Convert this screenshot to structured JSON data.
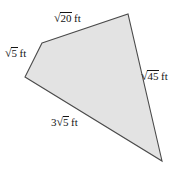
{
  "figure": {
    "type": "quadrilateral",
    "shape_name": "quadrilateral-diagram",
    "fill_color": "#e3e3e3",
    "stroke_color": "#4a4a4a",
    "background_color": "#ffffff",
    "vertices": [
      {
        "name": "top-left",
        "x": 42,
        "y": 43
      },
      {
        "name": "top-right",
        "x": 128,
        "y": 14
      },
      {
        "name": "bottom-right",
        "x": 162,
        "y": 161
      },
      {
        "name": "left",
        "x": 25,
        "y": 77
      }
    ],
    "unit": "ft",
    "radical_sign": "√",
    "sides": [
      {
        "position": "top",
        "coefficient": "",
        "radicand": "20",
        "unit": "ft",
        "full_text": "√20 ft",
        "from_vertex": "top-left",
        "to_vertex": "top-right"
      },
      {
        "position": "left",
        "coefficient": "",
        "radicand": "5",
        "unit": "ft",
        "full_text": "√5 ft",
        "from_vertex": "left",
        "to_vertex": "top-left"
      },
      {
        "position": "right",
        "coefficient": "",
        "radicand": "45",
        "unit": "ft",
        "full_text": "√45 ft",
        "from_vertex": "top-right",
        "to_vertex": "bottom-right"
      },
      {
        "position": "bottom",
        "coefficient": "3",
        "radicand": "5",
        "unit": "ft",
        "full_text": "3√5 ft",
        "from_vertex": "left",
        "to_vertex": "bottom-right"
      }
    ]
  }
}
